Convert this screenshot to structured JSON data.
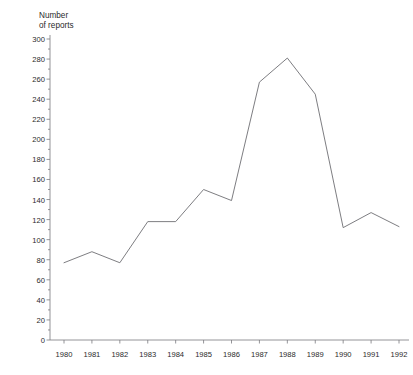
{
  "header": {
    "clipped_text": "                                                       "
  },
  "axis_title": "Number\nof reports",
  "style": {
    "line_color": "#6e6e73",
    "axis_color": "#7a7a7f",
    "text_color": "#2b2b2b",
    "background": "#ffffff"
  },
  "chart_data": {
    "type": "line",
    "title": "",
    "subtitle": "",
    "xlabel": "",
    "ylabel": "Number of reports",
    "x": [
      1980,
      1981,
      1982,
      1983,
      1984,
      1985,
      1986,
      1987,
      1988,
      1989,
      1990,
      1991,
      1992
    ],
    "categories": [
      "1980",
      "1981",
      "1982",
      "1983",
      "1984",
      "1985",
      "1986",
      "1987",
      "1988",
      "1989",
      "1990",
      "1991",
      "1992"
    ],
    "values": [
      77,
      88,
      77,
      118,
      118,
      150,
      139,
      257,
      281,
      245,
      112,
      127,
      113
    ],
    "series": [
      {
        "name": "Number of reports",
        "values": [
          77,
          88,
          77,
          118,
          118,
          150,
          139,
          257,
          281,
          245,
          112,
          127,
          113
        ]
      }
    ],
    "xlim": [
      1980,
      1992
    ],
    "ylim": [
      0,
      300
    ],
    "y_major_ticks": [
      0,
      20,
      40,
      60,
      80,
      100,
      120,
      140,
      160,
      180,
      200,
      220,
      240,
      260,
      280,
      300
    ],
    "y_tick_labels": [
      "0",
      "20",
      "40",
      "60",
      "80",
      "100",
      "120",
      "140",
      "160",
      "180",
      "200",
      "220",
      "240",
      "260",
      "280",
      "300"
    ],
    "y_minor_tick_interval": 10,
    "x_tick_labels": [
      "1980",
      "1981",
      "1982",
      "1983",
      "1984",
      "1985",
      "1986",
      "1987",
      "1988",
      "1989",
      "1990",
      "1991",
      "1992"
    ],
    "grid": false,
    "legend": false,
    "legend_position": "none",
    "markers": false,
    "annotations": []
  }
}
